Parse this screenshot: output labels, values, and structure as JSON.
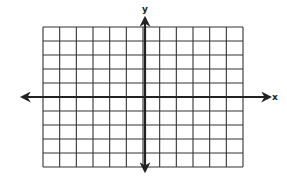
{
  "diagram": {
    "type": "coordinate-plane",
    "x_axis_label": "x",
    "y_axis_label": "y",
    "grid": {
      "columns": 12,
      "rows": 10,
      "columns_left_of_y_axis": 6,
      "columns_right_of_y_axis": 6,
      "rows_above_x_axis": 5,
      "rows_below_x_axis": 5,
      "left": 43,
      "right": 243,
      "top": 27,
      "bottom": 167
    },
    "origin": {
      "x": 145,
      "y": 97
    },
    "x_axis": {
      "start": 22,
      "end": 270
    },
    "y_axis": {
      "start": 18,
      "end": 171
    },
    "colors": {
      "grid_line": "#333333",
      "axis_line": "#222222",
      "background": "#ffffff"
    }
  }
}
